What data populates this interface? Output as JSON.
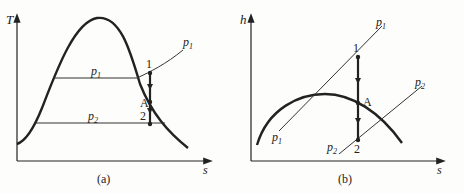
{
  "panels": [
    {
      "id": "a",
      "caption": "(a)",
      "y_axis": "T",
      "x_axis": "s",
      "isobar_labels": {
        "p1_line": "p",
        "p1_sub": "1",
        "p2_line": "p",
        "p2_sub": "2",
        "p1_curve": "p",
        "p1_curve_sub": "1"
      },
      "points": {
        "p1": "1",
        "pA": "A",
        "p2": "2"
      }
    },
    {
      "id": "b",
      "caption": "(b)",
      "y_axis": "h",
      "x_axis": "s",
      "isobar_labels": {
        "p1_top": "p",
        "p1_top_sub": "1",
        "p1_bottom": "p",
        "p1_bottom_sub": "1",
        "p2_top": "p",
        "p2_top_sub": "2",
        "p2_bottom": "p",
        "p2_bottom_sub": "2"
      },
      "points": {
        "p1": "1",
        "pA": "A",
        "p2": "2"
      }
    }
  ]
}
